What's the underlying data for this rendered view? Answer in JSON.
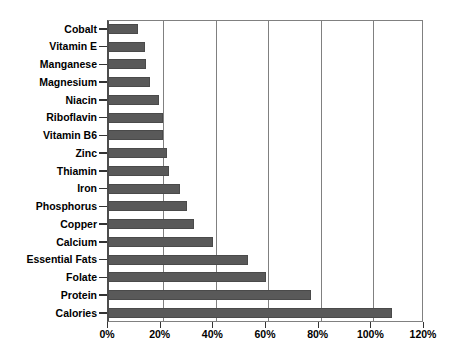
{
  "chart_data": {
    "type": "bar",
    "orientation": "horizontal",
    "title": "",
    "xlabel": "",
    "ylabel": "",
    "xlim": [
      0,
      120
    ],
    "xunit": "%",
    "grid": true,
    "legend": "none",
    "bar_color": "#595959",
    "axis_color": "#808080",
    "xticks": [
      "0%",
      "20%",
      "40%",
      "60%",
      "80%",
      "100%",
      "120%"
    ],
    "xtick_values": [
      0,
      20,
      40,
      60,
      80,
      100,
      120
    ],
    "categories": [
      "Cobalt",
      "Vitamin E",
      "Manganese",
      "Magnesium",
      "Niacin",
      "Riboflavin",
      "Vitamin B6",
      "Zinc",
      "Thiamin",
      "Iron",
      "Phosphorus",
      "Copper",
      "Calcium",
      "Essential Fats",
      "Folate",
      "Protein",
      "Calories"
    ],
    "values": [
      11.5,
      14,
      14.5,
      16,
      19.5,
      21,
      21,
      22.5,
      23,
      27.5,
      30,
      32.5,
      40,
      53,
      60,
      77,
      108
    ]
  }
}
